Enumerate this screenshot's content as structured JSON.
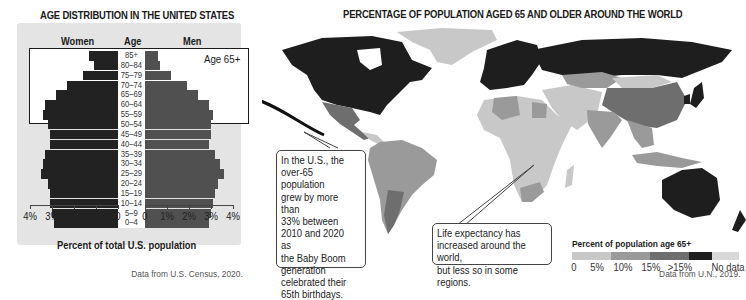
{
  "pyramid": {
    "title": "AGE DISTRIBUTION IN THE UNITED STATES",
    "col_women": "Women",
    "col_age": "Age",
    "col_men": "Men",
    "highlight_label": "Age 65+",
    "xlabel": "Percent of total U.S. population",
    "left_ticks": [
      "4%",
      "3%",
      "2%",
      "1%",
      "0"
    ],
    "right_ticks": [
      "0",
      "1%",
      "2%",
      "3%",
      "4%"
    ],
    "source": "Data from U.S. Census, 2020."
  },
  "map": {
    "title": "PERCENTAGE OF POPULATION AGED 65 AND OLDER AROUND THE WORLD",
    "callout_us": "In the U.S., the\nover-65 population\ngrew by more than\n33% between\n2010 and 2020 as\nthe Baby Boom\ngeneration\ncelebrated their\n65th birthdays.",
    "callout_life": "Life expectancy has\nincreased around the world,\nbut less so in some regions.",
    "legend_title": "Percent of population age 65+",
    "legend_labels": [
      "0",
      "5%",
      "10%",
      "15%",
      ">15%",
      "No data"
    ],
    "legend_colors": [
      "#c8c8c8",
      "#9a9a9a",
      "#6e6e6e",
      "#1e1e1e",
      "#d8d8d8"
    ],
    "source": "Data from U.N., 2019."
  },
  "chart_data": [
    {
      "type": "bar",
      "subtype": "population-pyramid",
      "title": "AGE DISTRIBUTION IN THE UNITED STATES",
      "xlabel": "Percent of total U.S. population",
      "ylabel": "Age",
      "xlim": [
        0,
        4
      ],
      "categories": [
        "85+",
        "80–84",
        "75–79",
        "70–74",
        "65–69",
        "60–64",
        "55–59",
        "50–54",
        "45–49",
        "40–44",
        "35–39",
        "30–34",
        "25–29",
        "20–24",
        "15–19",
        "10–14",
        "5–9",
        "0–4"
      ],
      "series": [
        {
          "name": "Women",
          "values": [
            1.3,
            1.1,
            1.6,
            2.3,
            2.8,
            3.3,
            3.4,
            3.2,
            3.1,
            3.1,
            3.3,
            3.4,
            3.5,
            3.2,
            3.1,
            3.1,
            3.0,
            2.9
          ]
        },
        {
          "name": "Men",
          "values": [
            0.6,
            0.7,
            1.2,
            1.9,
            2.4,
            2.9,
            3.1,
            3.0,
            3.0,
            2.9,
            3.2,
            3.4,
            3.6,
            3.3,
            3.2,
            3.1,
            3.0,
            2.9
          ]
        }
      ],
      "annotations": [
        "Age 65+ (highlighted: 65–69 through 85+)"
      ],
      "grid": false
    },
    {
      "type": "heatmap",
      "subtype": "choropleth-map",
      "title": "PERCENTAGE OF POPULATION AGED 65 AND OLDER AROUND THE WORLD",
      "legend_title": "Percent of population age 65+",
      "bins": [
        "0–5%",
        "5–10%",
        "10–15%",
        ">15%",
        "No data"
      ],
      "regions": [
        {
          "region": "United States / Canada",
          "bin": ">15%"
        },
        {
          "region": "Europe",
          "bin": ">15%"
        },
        {
          "region": "Russia",
          "bin": ">15%"
        },
        {
          "region": "Japan",
          "bin": ">15%"
        },
        {
          "region": "Australia / New Zealand",
          "bin": ">15%"
        },
        {
          "region": "China",
          "bin": "10–15%"
        },
        {
          "region": "Argentina / Uruguay",
          "bin": "10–15%"
        },
        {
          "region": "Mexico / South America",
          "bin": "5–10%"
        },
        {
          "region": "India / Southeast Asia",
          "bin": "5–10%"
        },
        {
          "region": "Middle East / Central Asia",
          "bin": "0–5%"
        },
        {
          "region": "Sub-Saharan Africa",
          "bin": "0–5%"
        },
        {
          "region": "Greenland",
          "bin": "No data"
        }
      ],
      "annotations": [
        "In the U.S., the over-65 population grew by more than 33% between 2010 and 2020 as the Baby Boom generation celebrated their 65th birthdays.",
        "Life expectancy has increased around the world, but less so in some regions."
      ]
    }
  ]
}
